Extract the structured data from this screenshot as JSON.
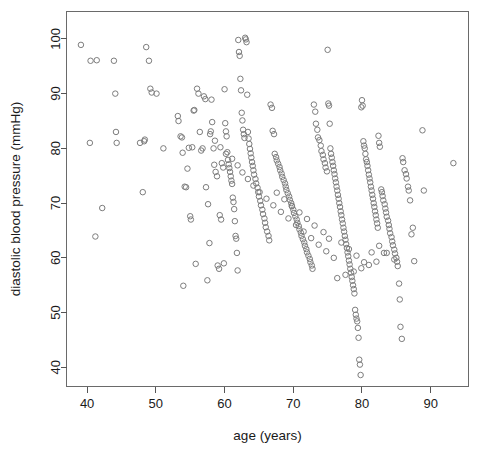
{
  "chart_data": {
    "type": "scatter",
    "title": "",
    "xlabel": "age (years)",
    "ylabel": "diastolic blood pressure (mmHg)",
    "xlim": [
      37.0,
      95.5
    ],
    "ylim": [
      36.5,
      105.0
    ],
    "xticks": [
      40,
      50,
      60,
      70,
      80,
      90
    ],
    "xticklabels": [
      "40",
      "50",
      "60",
      "70",
      "80",
      "90"
    ],
    "yticks": [
      40,
      50,
      60,
      70,
      80,
      90,
      100
    ],
    "yticklabels": [
      "40",
      "50",
      "60",
      "70",
      "80",
      "90",
      "100"
    ],
    "grid": false,
    "legend": null,
    "marker": "open-circle",
    "marker_color": "#7d7d7d",
    "marker_size": 5.5,
    "n_points": 331,
    "x": [
      39.1,
      40.4,
      40.5,
      41.2,
      41.4,
      42.2,
      43.9,
      44.1,
      44.2,
      44.3,
      47.7,
      48.1,
      48.3,
      48.4,
      48.6,
      49.0,
      49.2,
      49.4,
      50.1,
      51.1,
      53.2,
      53.3,
      53.6,
      53.8,
      53.9,
      54.0,
      54.2,
      54.4,
      54.6,
      54.8,
      55.0,
      55.1,
      55.3,
      55.5,
      55.6,
      55.8,
      56.0,
      56.2,
      56.4,
      56.6,
      56.8,
      57.0,
      57.2,
      57.3,
      57.5,
      57.6,
      57.8,
      58.0,
      58.1,
      58.2,
      58.4,
      58.5,
      58.7,
      58.9,
      59.0,
      59.2,
      59.3,
      59.5,
      59.6,
      59.8,
      59.9,
      60.0,
      60.1,
      60.2,
      60.3,
      60.4,
      60.5,
      60.6,
      60.7,
      60.8,
      60.9,
      61.0,
      61.1,
      61.2,
      61.3,
      61.4,
      61.5,
      61.6,
      61.7,
      61.8,
      61.9,
      62.0,
      62.1,
      62.2,
      62.3,
      62.4,
      62.5,
      62.6,
      62.7,
      62.8,
      62.9,
      63.0,
      63.1,
      63.2,
      63.3,
      63.4,
      63.5,
      63.6,
      63.7,
      63.8,
      63.9,
      64.0,
      64.1,
      64.2,
      64.3,
      64.5,
      64.6,
      64.8,
      64.9,
      65.0,
      65.2,
      65.3,
      65.5,
      65.6,
      65.8,
      65.9,
      66.0,
      66.2,
      66.4,
      66.5,
      66.7,
      66.9,
      67.0,
      67.2,
      67.3,
      67.5,
      67.6,
      67.8,
      68.0,
      68.1,
      68.3,
      68.4,
      68.6,
      68.8,
      68.9,
      69.0,
      69.2,
      69.4,
      69.5,
      69.7,
      69.8,
      70.0,
      70.1,
      70.3,
      70.5,
      70.6,
      70.8,
      70.9,
      71.1,
      71.2,
      71.4,
      71.6,
      71.7,
      71.9,
      72.0,
      72.2,
      72.4,
      72.5,
      72.7,
      72.8,
      73.0,
      73.2,
      73.3,
      73.5,
      73.6,
      73.8,
      74.0,
      74.1,
      74.3,
      74.4,
      74.6,
      74.7,
      74.9,
      75.0,
      75.1,
      75.2,
      75.3,
      75.4,
      75.5,
      75.6,
      75.7,
      75.8,
      75.9,
      76.0,
      76.1,
      76.2,
      76.3,
      76.4,
      76.5,
      76.6,
      76.7,
      76.8,
      76.9,
      77.0,
      77.1,
      77.2,
      77.3,
      77.4,
      77.5,
      77.6,
      77.7,
      77.8,
      77.9,
      78.0,
      78.1,
      78.2,
      78.3,
      78.4,
      78.5,
      78.6,
      78.7,
      78.8,
      78.9,
      79.0,
      79.1,
      79.2,
      79.3,
      79.4,
      79.5,
      79.6,
      79.7,
      79.8,
      79.9,
      80.0,
      80.1,
      80.2,
      80.3,
      80.4,
      80.5,
      80.6,
      80.7,
      80.8,
      80.9,
      81.0,
      81.1,
      81.2,
      81.3,
      81.4,
      81.5,
      81.6,
      81.7,
      81.8,
      81.9,
      82.0,
      82.1,
      82.2,
      82.3,
      82.4,
      82.5,
      82.6,
      82.8,
      82.9,
      83.0,
      83.1,
      83.3,
      83.4,
      83.5,
      83.6,
      83.8,
      83.9,
      84.0,
      84.1,
      84.3,
      84.4,
      84.5,
      84.7,
      84.8,
      85.0,
      85.1,
      85.2,
      85.4,
      85.5,
      85.6,
      85.8,
      85.9,
      86.0,
      86.2,
      86.4,
      86.5,
      86.7,
      86.8,
      87.0,
      87.2,
      87.4,
      87.6,
      88.8,
      89.0,
      93.3,
      57.9,
      58.6,
      59.4,
      60.2,
      61.1,
      61.9,
      62.6,
      63.4,
      64.2,
      65.1,
      66.1,
      67.1,
      68.2,
      69.3,
      70.4,
      71.5,
      72.6,
      73.7,
      74.8,
      75.9,
      77.0,
      78.1,
      79.2,
      80.3,
      81.4,
      82.5,
      83.6,
      84.7,
      76.4,
      77.6,
      78.8,
      79.9,
      81.0,
      82.1,
      83.2,
      75.2,
      74.4,
      73.1,
      72.0,
      70.9,
      69.8,
      68.7,
      67.6
    ],
    "y": [
      98.9,
      81.0,
      96.0,
      63.9,
      96.1,
      69.1,
      96.0,
      90.0,
      83.0,
      81.0,
      81.0,
      72.0,
      81.3,
      81.6,
      98.5,
      96.0,
      90.9,
      90.2,
      90.0,
      80.0,
      85.9,
      85.0,
      82.2,
      82.0,
      79.2,
      54.9,
      73.0,
      72.9,
      76.3,
      80.1,
      67.6,
      67.0,
      80.2,
      86.9,
      87.0,
      58.9,
      90.9,
      90.0,
      83.0,
      79.6,
      80.0,
      89.5,
      89.0,
      72.9,
      55.9,
      69.8,
      62.7,
      83.1,
      88.9,
      84.8,
      80.0,
      77.0,
      75.7,
      74.9,
      58.6,
      58.0,
      67.8,
      67.0,
      77.3,
      76.5,
      59.0,
      90.8,
      84.6,
      83.1,
      82.2,
      79.3,
      77.9,
      77.1,
      76.4,
      75.7,
      74.9,
      74.1,
      73.5,
      71.0,
      70.2,
      68.9,
      66.7,
      64.0,
      63.5,
      60.9,
      57.7,
      99.8,
      97.6,
      96.9,
      92.7,
      90.6,
      86.5,
      85.1,
      83.4,
      82.6,
      81.9,
      100.2,
      99.9,
      99.4,
      89.8,
      83.0,
      81.8,
      80.8,
      79.9,
      79.1,
      78.3,
      77.5,
      76.8,
      76.0,
      75.2,
      74.4,
      73.6,
      72.8,
      72.0,
      71.2,
      70.4,
      69.6,
      68.8,
      68.0,
      67.2,
      66.4,
      65.6,
      64.8,
      64.0,
      63.2,
      88.0,
      87.4,
      83.2,
      82.6,
      79.0,
      78.4,
      77.8,
      77.2,
      76.6,
      76.0,
      75.4,
      74.8,
      74.2,
      73.6,
      73.0,
      72.4,
      71.8,
      71.2,
      70.6,
      70.0,
      69.4,
      68.8,
      68.2,
      67.6,
      67.0,
      66.4,
      65.8,
      65.2,
      64.6,
      64.0,
      63.4,
      62.8,
      62.2,
      61.6,
      61.0,
      60.4,
      59.8,
      59.2,
      58.6,
      58.0,
      88.0,
      86.7,
      84.5,
      83.4,
      82.0,
      81.5,
      80.5,
      79.5,
      78.8,
      78.0,
      77.3,
      76.5,
      75.8,
      98.0,
      88.2,
      87.8,
      84.5,
      80.0,
      79.0,
      78.3,
      77.5,
      76.8,
      76.0,
      75.3,
      74.5,
      73.8,
      73.0,
      72.3,
      71.5,
      70.8,
      70.0,
      69.3,
      68.5,
      67.8,
      67.0,
      66.3,
      65.5,
      64.8,
      64.0,
      63.3,
      62.5,
      61.8,
      61.0,
      60.3,
      59.5,
      58.8,
      58.0,
      57.3,
      56.5,
      55.8,
      55.0,
      54.3,
      53.5,
      50.5,
      49.6,
      48.9,
      48.4,
      47.2,
      45.4,
      41.4,
      40.5,
      38.6,
      87.5,
      88.8,
      87.8,
      81.3,
      80.5,
      80.0,
      79.0,
      78.0,
      77.5,
      76.8,
      76.0,
      75.2,
      74.5,
      73.8,
      73.0,
      72.3,
      71.5,
      70.8,
      70.0,
      69.3,
      68.5,
      67.8,
      67.0,
      66.3,
      65.5,
      82.3,
      81.0,
      80.3,
      72.5,
      72.0,
      71.3,
      70.5,
      69.8,
      69.0,
      68.3,
      67.5,
      66.8,
      66.0,
      65.3,
      64.5,
      63.8,
      63.0,
      62.3,
      61.5,
      60.8,
      60.0,
      59.3,
      58.5,
      55.3,
      52.4,
      47.4,
      45.2,
      78.2,
      77.5,
      76.0,
      75.3,
      74.5,
      73.0,
      72.3,
      70.5,
      64.3,
      65.5,
      59.4,
      83.3,
      72.3,
      77.3,
      82.6,
      81.4,
      80.2,
      79.0,
      78.1,
      76.9,
      75.6,
      74.4,
      73.2,
      72.0,
      70.8,
      69.6,
      68.4,
      67.2,
      66.0,
      64.8,
      63.6,
      62.4,
      61.2,
      60.0,
      62.8,
      61.6,
      60.4,
      59.2,
      61.0,
      62.2,
      60.9,
      59.7,
      56.3,
      56.9,
      57.5,
      58.1,
      58.7,
      59.3,
      60.9,
      63.5,
      64.7,
      65.9,
      67.1,
      68.3,
      69.5,
      70.7,
      71.9
    ]
  },
  "axes": {
    "x_title": "age (years)",
    "y_title": "diastolic blood pressure (mmHg)"
  }
}
